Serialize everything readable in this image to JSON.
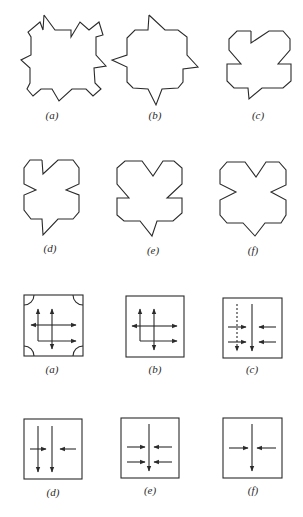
{
  "figure_top": {
    "description": "Polygon outlines",
    "panels": [
      {
        "id": "a",
        "label": "(a)"
      },
      {
        "id": "b",
        "label": "(b)"
      },
      {
        "id": "c",
        "label": "(c)"
      },
      {
        "id": "d",
        "label": "(d)"
      },
      {
        "id": "e",
        "label": "(e)"
      },
      {
        "id": "f",
        "label": "(f)"
      }
    ]
  },
  "figure_bottom": {
    "description": "Boxed arrow diagrams",
    "panels": [
      {
        "id": "a",
        "label": "(a)"
      },
      {
        "id": "b",
        "label": "(b)"
      },
      {
        "id": "c",
        "label": "(c)"
      },
      {
        "id": "d",
        "label": "(d)"
      },
      {
        "id": "e",
        "label": "(e)"
      },
      {
        "id": "f",
        "label": "(f)"
      }
    ]
  },
  "colors": {
    "ink": "#2a2a2a",
    "background": "#ffffff"
  }
}
